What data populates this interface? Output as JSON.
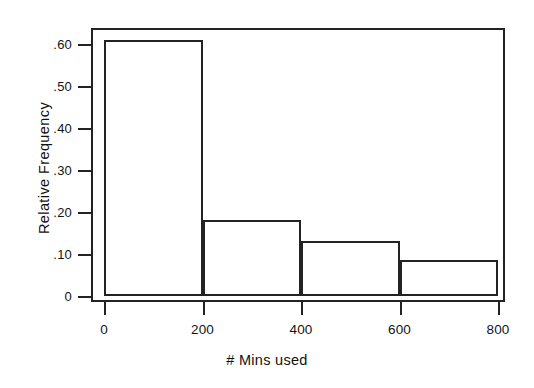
{
  "chart_data": {
    "type": "bar",
    "title": "",
    "subtitle": "",
    "xlabel": "# Mins used",
    "ylabel": "Relative Frequency",
    "categories": [
      "0-200",
      "200-400",
      "400-600",
      "600-800"
    ],
    "bin_edges": [
      0,
      200,
      400,
      600,
      800
    ],
    "values": [
      0.61,
      0.18,
      0.13,
      0.085
    ],
    "xlim": [
      0,
      800
    ],
    "ylim": [
      0,
      0.65
    ],
    "xticks": [
      0,
      200,
      400,
      600,
      800
    ],
    "xtick_labels": [
      "0",
      "200",
      "400",
      "600",
      "800"
    ],
    "yticks": [
      0,
      0.1,
      0.2,
      0.3,
      0.4,
      0.5,
      0.6
    ],
    "ytick_labels": [
      "0",
      ".10",
      ".20",
      ".30",
      ".40",
      ".50",
      ".60"
    ],
    "grid": false,
    "legend": false,
    "legend_position": "none",
    "bar_fill": "#ffffff",
    "bar_edge_color": "#232323",
    "frame_color": "#232323",
    "background": "#ffffff"
  }
}
